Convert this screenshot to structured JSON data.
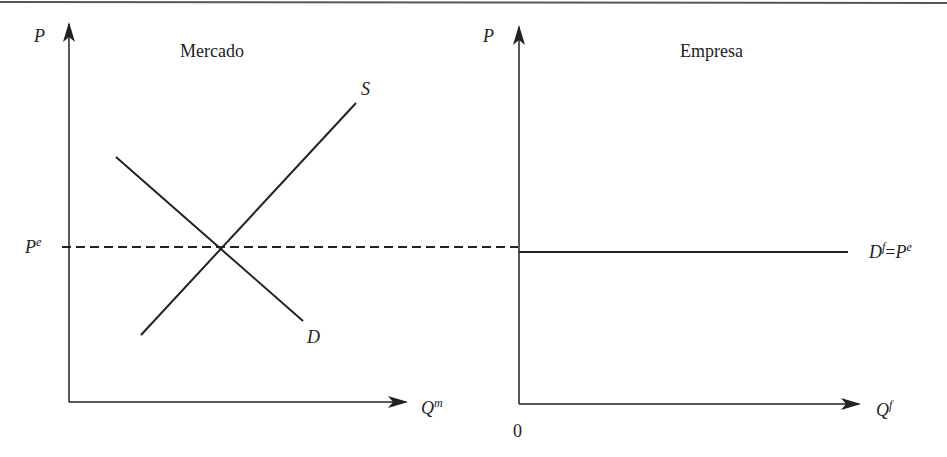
{
  "top_rule": {
    "color": "#555555"
  },
  "market_panel": {
    "title": "Mercado",
    "y_axis_label": "P",
    "x_axis_label": "Q",
    "x_axis_superscript": "m",
    "equilibrium_price_label": "P",
    "equilibrium_price_superscript": "e",
    "supply_label": "S",
    "demand_label": "D"
  },
  "firm_panel": {
    "title": "Empresa",
    "y_axis_label": "P",
    "x_axis_label": "Q",
    "x_axis_superscript": "f",
    "origin_label": "0",
    "demand_label": "D",
    "demand_superscript": "f",
    "equals": "=",
    "demand_price_label": "P",
    "demand_price_superscript": "e"
  },
  "colors": {
    "line": "#222222",
    "text": "#222222"
  }
}
